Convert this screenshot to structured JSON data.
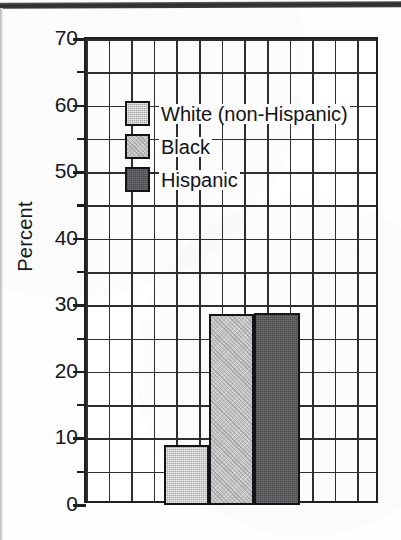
{
  "chart_data": {
    "type": "bar",
    "title": "",
    "xlabel": "",
    "ylabel": "Percent",
    "ylim": [
      0,
      70
    ],
    "ytick_labels": [
      "70",
      "60",
      "50",
      "40",
      "30",
      "20",
      "10",
      "0"
    ],
    "ytick_values": [
      70,
      60,
      50,
      40,
      30,
      20,
      10,
      0
    ],
    "ytick_step": 10,
    "gridline_step": 5,
    "grid": true,
    "grid_columns": 13,
    "grid_rows": 14,
    "legend_position": "upper-left-inside",
    "categories": [
      "White (non-Hispanic)",
      "Black",
      "Hispanic"
    ],
    "values": [
      9.0,
      28.7,
      28.8
    ],
    "series": [
      {
        "name": "White (non-Hispanic)",
        "value": 9.0,
        "color": "#a9a9a9"
      },
      {
        "name": "Black",
        "value": 28.7,
        "color": "#c4c4c4"
      },
      {
        "name": "Hispanic",
        "value": 28.8,
        "color": "#59595b"
      }
    ]
  },
  "legend": {
    "items": [
      {
        "label": "White (non-Hispanic)",
        "swatch": "sw-white"
      },
      {
        "label": "Black",
        "swatch": "sw-black"
      },
      {
        "label": "Hispanic",
        "swatch": "sw-hispanic"
      }
    ]
  },
  "axis": {
    "y_title": "Percent"
  },
  "colors": {
    "ink": "#1d1f22",
    "white_series": "#a9a9a9",
    "black_series": "#c4c4c4",
    "hispanic_series": "#59595b",
    "page": "#ffffff"
  }
}
